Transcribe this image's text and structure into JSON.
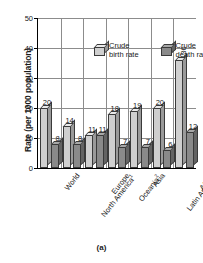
{
  "caption": "(a)",
  "chart_data": {
    "type": "bar",
    "title": "",
    "xlabel": "",
    "ylabel": "Rate (per 1000 population)",
    "ylim": [
      0,
      50
    ],
    "yticks": [
      0,
      10,
      20,
      30,
      40,
      50
    ],
    "grid": true,
    "legend_position": "top-center",
    "categories": [
      "World",
      "North America",
      "Europe",
      "Oceania",
      "Asia",
      "Latin America and the Caribbean",
      "Africa"
    ],
    "category_footnotes": [
      "",
      "1",
      "",
      "2",
      "",
      "",
      ""
    ],
    "series": [
      {
        "name": "Crude birth rate",
        "values": [
          20,
          14,
          11,
          18,
          19,
          20,
          36
        ]
      },
      {
        "name": "Crude death rate",
        "values": [
          8,
          8,
          11,
          7,
          7,
          6,
          12
        ]
      }
    ]
  },
  "legend": {
    "entries": [
      {
        "line1": "Crude",
        "line2": "birth rate"
      },
      {
        "line1": "Crude",
        "line2": "death rate"
      }
    ]
  }
}
